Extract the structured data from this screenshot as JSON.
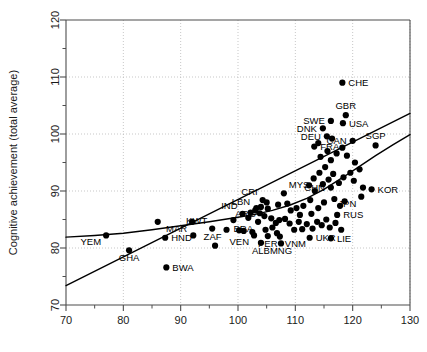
{
  "chart_data": {
    "type": "scatter",
    "title": "",
    "xlabel": "",
    "ylabel": "Cognitive achievement (total average)",
    "xlim": [
      70,
      130
    ],
    "ylim": [
      70,
      120
    ],
    "xticks": [
      70,
      80,
      90,
      100,
      110,
      120,
      130
    ],
    "xtick_labels": [
      "70",
      "80",
      "90",
      "100",
      "110",
      "120",
      "130"
    ],
    "yticks": [
      70,
      80,
      90,
      100,
      110,
      120
    ],
    "ytick_labels": [
      "70",
      "80",
      "90",
      "100",
      "110",
      "120"
    ],
    "xminor_ticks": [
      75,
      85,
      95,
      105,
      115,
      125
    ],
    "yminor_ticks": [
      75,
      85,
      95,
      105,
      115
    ],
    "grid": true,
    "grid_style": "dotted",
    "legend": null,
    "marker": {
      "shape": "circle",
      "color": "#000000",
      "size": 3.1
    },
    "points": [
      {
        "label": "YEM",
        "x": 77.0,
        "y": 82.2,
        "label_pos": "below-left"
      },
      {
        "label": "GHA",
        "x": 81.0,
        "y": 79.6,
        "label_pos": "below"
      },
      {
        "label": "HND",
        "x": 87.3,
        "y": 81.8,
        "label_pos": "right"
      },
      {
        "label": "BWA",
        "x": 87.5,
        "y": 76.6,
        "label_pos": "right"
      },
      {
        "label": "MAR",
        "x": 92.0,
        "y": 84.6,
        "label_pos": "below-left"
      },
      {
        "label": "KWT",
        "x": 95.5,
        "y": 83.4,
        "label_pos": "above-left"
      },
      {
        "label": "ZAF",
        "x": 98.0,
        "y": 83.2,
        "label_pos": "below-left"
      },
      {
        "label": "IND",
        "x": 100.8,
        "y": 86.0,
        "label_pos": "above-left"
      },
      {
        "label": "LBN",
        "x": 103.0,
        "y": 86.6,
        "label_pos": "above-left"
      },
      {
        "label": "VEN",
        "x": 102.8,
        "y": 82.2,
        "label_pos": "below-left"
      },
      {
        "label": "ALB",
        "x": 104.0,
        "y": 80.9,
        "label_pos": "below"
      },
      {
        "label": "PER",
        "x": 105.2,
        "y": 82.1,
        "label_pos": "below"
      },
      {
        "label": "VNM",
        "x": 107.3,
        "y": 82.0,
        "label_pos": "below-right"
      },
      {
        "label": "MNG",
        "x": 107.5,
        "y": 80.8,
        "label_pos": "below"
      },
      {
        "label": "BRA",
        "x": 103.5,
        "y": 84.6,
        "label_pos": "below-left"
      },
      {
        "label": "ARG",
        "x": 104.0,
        "y": 87.2,
        "label_pos": "below-left"
      },
      {
        "label": "CRI",
        "x": 104.3,
        "y": 88.4,
        "label_pos": "above-left"
      },
      {
        "label": "MYS",
        "x": 108.0,
        "y": 89.6,
        "label_pos": "above-right"
      },
      {
        "label": "UKR",
        "x": 112.5,
        "y": 81.8,
        "label_pos": "right"
      },
      {
        "label": "LIE",
        "x": 116.2,
        "y": 81.7,
        "label_pos": "right"
      },
      {
        "label": "RUS",
        "x": 117.3,
        "y": 85.8,
        "label_pos": "right"
      },
      {
        "label": "CHN",
        "x": 116.2,
        "y": 90.6,
        "label_pos": "left"
      },
      {
        "label": "JPN",
        "x": 121.5,
        "y": 89.0,
        "label_pos": "below-left"
      },
      {
        "label": "KOR",
        "x": 123.3,
        "y": 90.3,
        "label_pos": "right"
      },
      {
        "label": "FRA",
        "x": 113.3,
        "y": 97.8,
        "label_pos": "right"
      },
      {
        "label": "DEU",
        "x": 115.5,
        "y": 99.6,
        "label_pos": "left"
      },
      {
        "label": "DNK",
        "x": 114.8,
        "y": 101.0,
        "label_pos": "left"
      },
      {
        "label": "SWE",
        "x": 116.2,
        "y": 102.3,
        "label_pos": "left"
      },
      {
        "label": "USA",
        "x": 118.3,
        "y": 101.9,
        "label_pos": "right"
      },
      {
        "label": "GBR",
        "x": 118.8,
        "y": 103.3,
        "label_pos": "above"
      },
      {
        "label": "CHE",
        "x": 118.2,
        "y": 109.0,
        "label_pos": "right"
      },
      {
        "label": "CAN",
        "x": 120.0,
        "y": 98.8,
        "label_pos": "left"
      },
      {
        "label": "SGP",
        "x": 124.0,
        "y": 98.0,
        "label_pos": "above"
      },
      {
        "label": "",
        "x": 86.0,
        "y": 84.6
      },
      {
        "label": "",
        "x": 92.2,
        "y": 82.2
      },
      {
        "label": "",
        "x": 96.0,
        "y": 80.4
      },
      {
        "label": "",
        "x": 99.2,
        "y": 84.9
      },
      {
        "label": "",
        "x": 100.2,
        "y": 83.1
      },
      {
        "label": "",
        "x": 101.8,
        "y": 85.3
      },
      {
        "label": "",
        "x": 102.2,
        "y": 86.2
      },
      {
        "label": "",
        "x": 103.8,
        "y": 86.1
      },
      {
        "label": "",
        "x": 104.6,
        "y": 85.6
      },
      {
        "label": "",
        "x": 105.2,
        "y": 86.9
      },
      {
        "label": "",
        "x": 105.8,
        "y": 85.2
      },
      {
        "label": "",
        "x": 106.0,
        "y": 83.6
      },
      {
        "label": "",
        "x": 106.6,
        "y": 84.4
      },
      {
        "label": "",
        "x": 107.2,
        "y": 84.9
      },
      {
        "label": "",
        "x": 108.2,
        "y": 85.1
      },
      {
        "label": "",
        "x": 101.0,
        "y": 83.0
      },
      {
        "label": "",
        "x": 102.5,
        "y": 82.8
      },
      {
        "label": "",
        "x": 104.8,
        "y": 83.2
      },
      {
        "label": "",
        "x": 106.8,
        "y": 82.6
      },
      {
        "label": "",
        "x": 109.0,
        "y": 84.3
      },
      {
        "label": "",
        "x": 109.8,
        "y": 83.2
      },
      {
        "label": "",
        "x": 110.6,
        "y": 84.6
      },
      {
        "label": "",
        "x": 111.2,
        "y": 83.3
      },
      {
        "label": "",
        "x": 112.0,
        "y": 84.2
      },
      {
        "label": "",
        "x": 113.0,
        "y": 83.4
      },
      {
        "label": "",
        "x": 113.8,
        "y": 84.6
      },
      {
        "label": "",
        "x": 114.6,
        "y": 84.0
      },
      {
        "label": "",
        "x": 115.4,
        "y": 85.0
      },
      {
        "label": "",
        "x": 116.0,
        "y": 83.6
      },
      {
        "label": "",
        "x": 117.0,
        "y": 84.4
      },
      {
        "label": "",
        "x": 118.0,
        "y": 83.2
      },
      {
        "label": "",
        "x": 114.0,
        "y": 87.0
      },
      {
        "label": "",
        "x": 115.0,
        "y": 88.0
      },
      {
        "label": "",
        "x": 116.8,
        "y": 88.6
      },
      {
        "label": "",
        "x": 117.8,
        "y": 87.4
      },
      {
        "label": "",
        "x": 118.6,
        "y": 88.2
      },
      {
        "label": "",
        "x": 112.6,
        "y": 88.4
      },
      {
        "label": "",
        "x": 111.4,
        "y": 87.4
      },
      {
        "label": "",
        "x": 110.2,
        "y": 87.0
      },
      {
        "label": "",
        "x": 109.2,
        "y": 86.6
      },
      {
        "label": "",
        "x": 113.4,
        "y": 90.0
      },
      {
        "label": "",
        "x": 114.8,
        "y": 91.2
      },
      {
        "label": "",
        "x": 115.8,
        "y": 92.0
      },
      {
        "label": "",
        "x": 116.6,
        "y": 93.0
      },
      {
        "label": "",
        "x": 115.2,
        "y": 94.2
      },
      {
        "label": "",
        "x": 114.2,
        "y": 93.2
      },
      {
        "label": "",
        "x": 113.2,
        "y": 92.2
      },
      {
        "label": "",
        "x": 112.4,
        "y": 91.0
      },
      {
        "label": "",
        "x": 116.2,
        "y": 95.4
      },
      {
        "label": "",
        "x": 117.2,
        "y": 96.6
      },
      {
        "label": "",
        "x": 114.4,
        "y": 96.0
      },
      {
        "label": "",
        "x": 115.6,
        "y": 97.0
      },
      {
        "label": "",
        "x": 118.2,
        "y": 97.6
      },
      {
        "label": "",
        "x": 119.0,
        "y": 96.2
      },
      {
        "label": "",
        "x": 120.4,
        "y": 95.0
      },
      {
        "label": "",
        "x": 121.2,
        "y": 93.8
      },
      {
        "label": "",
        "x": 119.6,
        "y": 93.2
      },
      {
        "label": "",
        "x": 118.4,
        "y": 92.4
      },
      {
        "label": "",
        "x": 117.6,
        "y": 91.4
      },
      {
        "label": "",
        "x": 120.2,
        "y": 91.8
      },
      {
        "label": "",
        "x": 121.8,
        "y": 90.6
      },
      {
        "label": "",
        "x": 112.8,
        "y": 86.0
      },
      {
        "label": "",
        "x": 110.8,
        "y": 85.8
      },
      {
        "label": "",
        "x": 108.6,
        "y": 87.8
      },
      {
        "label": "",
        "x": 107.0,
        "y": 87.6
      },
      {
        "label": "",
        "x": 105.0,
        "y": 88.0
      },
      {
        "label": "",
        "x": 103.2,
        "y": 87.0
      },
      {
        "label": "",
        "x": 116.4,
        "y": 99.2
      },
      {
        "label": "",
        "x": 114.0,
        "y": 98.4
      }
    ],
    "lines": [
      {
        "name": "linear-fit",
        "style": "solid",
        "color": "#000000",
        "width": 1.4,
        "points": [
          [
            70,
            73.4
          ],
          [
            130,
            103.6
          ]
        ]
      },
      {
        "name": "nonparametric-fit",
        "style": "solid",
        "color": "#000000",
        "width": 1.4,
        "points": [
          [
            70,
            81.9
          ],
          [
            75,
            82.2
          ],
          [
            80,
            82.6
          ],
          [
            85,
            83.2
          ],
          [
            90,
            83.9
          ],
          [
            95,
            84.6
          ],
          [
            100,
            85.4
          ],
          [
            103,
            85.9
          ],
          [
            106,
            86.6
          ],
          [
            109,
            87.5
          ],
          [
            112,
            88.7
          ],
          [
            115,
            90.3
          ],
          [
            118,
            92.2
          ],
          [
            121,
            94.2
          ],
          [
            124,
            96.2
          ],
          [
            127,
            98.1
          ],
          [
            130,
            99.9
          ]
        ]
      }
    ]
  }
}
